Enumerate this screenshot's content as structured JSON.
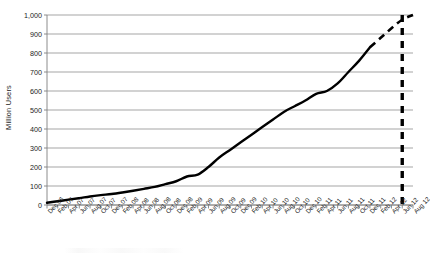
{
  "chart_data": {
    "type": "line",
    "title": "",
    "xlabel": "",
    "ylabel": "Million Users",
    "ylim": [
      0,
      1000
    ],
    "ytick_values": [
      0,
      100,
      200,
      300,
      400,
      500,
      600,
      700,
      800,
      900,
      1000
    ],
    "ytick_labels": [
      "0",
      "100",
      "200",
      "300",
      "400",
      "500",
      "600",
      "700",
      "800",
      "900",
      "1,000"
    ],
    "grid": true,
    "legend": "none",
    "categories": [
      "Dec 06",
      "Feb 07",
      "Apr 07",
      "Jun 07",
      "Aug 07",
      "Oct 07",
      "Dec 07",
      "Feb 08",
      "Apr 08",
      "Jun 08",
      "Aug 08",
      "Oct 08",
      "Dec 08",
      "Feb 09",
      "Apr 09",
      "Jun 09",
      "Aug 09",
      "Oct 09",
      "Dec 09",
      "Feb 10",
      "Apr 10",
      "Jun 10",
      "Aug 10",
      "Oct 10",
      "Dec 10",
      "Feb 11",
      "Apr 11",
      "Jun 11",
      "Aug 11",
      "Oct 11",
      "Dec 11",
      "Feb 12",
      "Apr 12",
      "Jun 12",
      "Aug 12"
    ],
    "series": [
      {
        "name": "Actual users",
        "style": "solid",
        "values": [
          12,
          20,
          28,
          36,
          45,
          52,
          58,
          66,
          75,
          85,
          95,
          110,
          125,
          150,
          160,
          200,
          250,
          290,
          330,
          370,
          410,
          450,
          490,
          520,
          550,
          585,
          600,
          640,
          700,
          760,
          830,
          null,
          null,
          null,
          null
        ]
      },
      {
        "name": "Projected users",
        "style": "dashed",
        "values": [
          null,
          null,
          null,
          null,
          null,
          null,
          null,
          null,
          null,
          null,
          null,
          null,
          null,
          null,
          null,
          null,
          null,
          null,
          null,
          null,
          null,
          null,
          null,
          null,
          null,
          null,
          null,
          null,
          null,
          null,
          830,
          880,
          930,
          975,
          1000
        ]
      }
    ],
    "annotations": [
      {
        "name": "one-billion-marker",
        "type": "vertical-line",
        "style": "bold-dashed",
        "x_category": "Jun 12",
        "y_from": 0,
        "y_to": 1000
      }
    ]
  },
  "colors": {
    "line": "#000000",
    "grid": "#808080",
    "axis": "#808080",
    "text": "#222222",
    "background": "#ffffff"
  }
}
